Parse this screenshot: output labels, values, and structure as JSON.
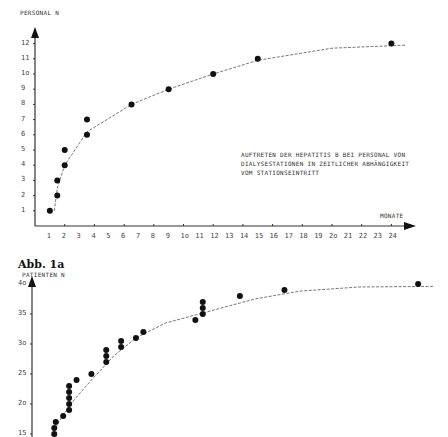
{
  "figure_label": "Abb. 1a",
  "chart_data": [
    {
      "type": "scatter",
      "title": "Auftreten der Hepatitis B bei Personal von Dialysestationen in zeitlicher Abhängigkeit vom Stationseintritt",
      "caption_lines": [
        "Auftreten der Hepatitis B bei Personal von",
        "Dialysestationen in zeitlicher Abhängigkeit",
        "vom Stationseintritt"
      ],
      "xlabel": "Monate",
      "ylabel": "Personal N",
      "x_ticks": [
        "1",
        "2",
        "3",
        "4",
        "5",
        "6",
        "7",
        "8",
        "9",
        "1o",
        "11",
        "12",
        "13",
        "14",
        "15",
        "16",
        "17",
        "18",
        "19",
        "2o",
        "21",
        "22",
        "23",
        "24"
      ],
      "y_ticks": [
        "1",
        "2",
        "3",
        "4",
        "5",
        "6",
        "7",
        "8",
        "9",
        "1o",
        "11",
        "12"
      ],
      "xlim": [
        0,
        25
      ],
      "ylim": [
        0,
        12.5
      ],
      "grid": false,
      "points": [
        {
          "x": 1.0,
          "y": 1
        },
        {
          "x": 1.5,
          "y": 2
        },
        {
          "x": 1.5,
          "y": 3
        },
        {
          "x": 2.0,
          "y": 4
        },
        {
          "x": 2.0,
          "y": 5
        },
        {
          "x": 3.5,
          "y": 6
        },
        {
          "x": 3.5,
          "y": 7
        },
        {
          "x": 6.5,
          "y": 8
        },
        {
          "x": 9.0,
          "y": 9
        },
        {
          "x": 12.0,
          "y": 10
        },
        {
          "x": 15.0,
          "y": 11
        },
        {
          "x": 24.0,
          "y": 12
        }
      ],
      "fit_curve": {
        "style": "dashed",
        "points": [
          [
            1.3,
            1
          ],
          [
            1.5,
            2.5
          ],
          [
            2,
            4
          ],
          [
            3.5,
            6.2
          ],
          [
            6.5,
            8
          ],
          [
            9,
            9
          ],
          [
            12,
            10
          ],
          [
            15,
            10.9
          ],
          [
            20,
            11.7
          ],
          [
            25,
            11.9
          ]
        ]
      }
    },
    {
      "type": "scatter",
      "title": "",
      "ylabel": "Patienten n",
      "xlabel": "",
      "y_ticks": [
        "15",
        "2o",
        "25",
        "3o",
        "35",
        "4o"
      ],
      "ylim": [
        15,
        41
      ],
      "grid": false,
      "points": [
        {
          "x": 1.5,
          "y": 15
        },
        {
          "x": 1.5,
          "y": 16
        },
        {
          "x": 1.6,
          "y": 17
        },
        {
          "x": 2.1,
          "y": 18
        },
        {
          "x": 2.5,
          "y": 19
        },
        {
          "x": 2.5,
          "y": 20
        },
        {
          "x": 2.5,
          "y": 21
        },
        {
          "x": 2.5,
          "y": 22
        },
        {
          "x": 2.5,
          "y": 23
        },
        {
          "x": 3.0,
          "y": 24
        },
        {
          "x": 4.0,
          "y": 25
        },
        {
          "x": 5.0,
          "y": 27
        },
        {
          "x": 5.0,
          "y": 28
        },
        {
          "x": 5.0,
          "y": 29
        },
        {
          "x": 6.0,
          "y": 29.5
        },
        {
          "x": 6.0,
          "y": 30.5
        },
        {
          "x": 7.0,
          "y": 31
        },
        {
          "x": 7.5,
          "y": 32
        },
        {
          "x": 11.0,
          "y": 34
        },
        {
          "x": 11.5,
          "y": 35
        },
        {
          "x": 11.5,
          "y": 36
        },
        {
          "x": 11.5,
          "y": 37
        },
        {
          "x": 14.0,
          "y": 38
        },
        {
          "x": 17.0,
          "y": 39
        },
        {
          "x": 26.0,
          "y": 40
        }
      ]
    }
  ]
}
